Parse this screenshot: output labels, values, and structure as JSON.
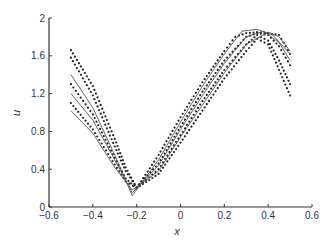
{
  "chart_data": {
    "type": "line",
    "title": "",
    "xlabel": "x",
    "ylabel": "u",
    "xlim": [
      -0.6,
      0.6
    ],
    "ylim": [
      0,
      2
    ],
    "xticks": [
      "-0.6",
      "-0.4",
      "-0.2",
      "0",
      "0.2",
      "0.4",
      "0.6"
    ],
    "yticks": [
      "0",
      "0.4",
      "0.8",
      "1.2",
      "1.6",
      "2"
    ],
    "grid": false,
    "legend": null,
    "colors": {
      "axis": "#333333",
      "line": "#555555",
      "dots": "#222222"
    },
    "series": [
      {
        "name": "dotted-1",
        "style": "dots",
        "x": [
          -0.5,
          -0.4,
          -0.3,
          -0.25,
          -0.2,
          -0.1,
          0.0,
          0.1,
          0.2,
          0.25,
          0.3,
          0.35,
          0.4,
          0.45,
          0.5
        ],
        "y": [
          1.66,
          1.28,
          0.72,
          0.42,
          0.2,
          0.55,
          0.95,
          1.32,
          1.65,
          1.8,
          1.84,
          1.85,
          1.84,
          1.82,
          1.62
        ]
      },
      {
        "name": "dotted-2",
        "style": "dots",
        "x": [
          -0.5,
          -0.4,
          -0.3,
          -0.25,
          -0.2,
          -0.1,
          0.0,
          0.1,
          0.2,
          0.3,
          0.35,
          0.4,
          0.45,
          0.5
        ],
        "y": [
          1.58,
          1.18,
          0.64,
          0.38,
          0.21,
          0.46,
          0.85,
          1.22,
          1.55,
          1.8,
          1.84,
          1.82,
          1.7,
          1.5
        ]
      },
      {
        "name": "dotted-3",
        "style": "dots",
        "x": [
          -0.5,
          -0.4,
          -0.3,
          -0.25,
          -0.2,
          -0.1,
          0.0,
          0.1,
          0.2,
          0.3,
          0.35,
          0.4,
          0.45,
          0.5
        ],
        "y": [
          1.3,
          0.98,
          0.52,
          0.3,
          0.2,
          0.4,
          0.76,
          1.12,
          1.45,
          1.72,
          1.82,
          1.76,
          1.55,
          1.3
        ]
      },
      {
        "name": "dotted-4",
        "style": "dots",
        "x": [
          -0.5,
          -0.4,
          -0.3,
          -0.25,
          -0.2,
          -0.1,
          0.0,
          0.1,
          0.2,
          0.3,
          0.35,
          0.4,
          0.45,
          0.5
        ],
        "y": [
          1.1,
          0.82,
          0.45,
          0.27,
          0.2,
          0.35,
          0.68,
          1.02,
          1.36,
          1.65,
          1.78,
          1.72,
          1.45,
          1.18
        ]
      },
      {
        "name": "solid-1",
        "style": "line",
        "x": [
          -0.5,
          -0.4,
          -0.3,
          -0.22,
          -0.1,
          0.0,
          0.1,
          0.2,
          0.28,
          0.35,
          0.42,
          0.5
        ],
        "y": [
          1.4,
          1.05,
          0.55,
          0.12,
          0.5,
          0.9,
          1.28,
          1.62,
          1.86,
          1.88,
          1.82,
          1.62
        ]
      },
      {
        "name": "solid-2",
        "style": "line",
        "x": [
          -0.5,
          -0.4,
          -0.3,
          -0.22,
          -0.1,
          0.0,
          0.1,
          0.2,
          0.3,
          0.38,
          0.45,
          0.5
        ],
        "y": [
          1.2,
          0.92,
          0.5,
          0.15,
          0.44,
          0.82,
          1.18,
          1.52,
          1.8,
          1.86,
          1.74,
          1.55
        ]
      },
      {
        "name": "solid-3",
        "style": "line",
        "x": [
          -0.5,
          -0.4,
          -0.3,
          -0.22,
          -0.1,
          0.0,
          0.1,
          0.2,
          0.3,
          0.4,
          0.45,
          0.5
        ],
        "y": [
          1.02,
          0.78,
          0.42,
          0.18,
          0.38,
          0.74,
          1.08,
          1.42,
          1.72,
          1.85,
          1.8,
          1.65
        ]
      }
    ]
  }
}
